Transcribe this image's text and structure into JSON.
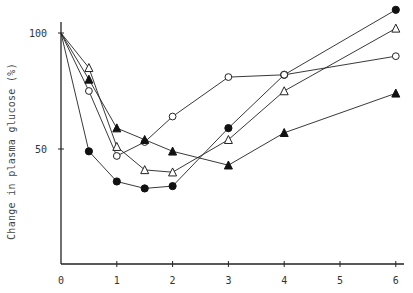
{
  "chart_data": {
    "type": "line",
    "title": "",
    "xlabel": "",
    "ylabel": "Change in plasma glucose (%)",
    "x_ticks": [
      "0",
      "1",
      "2",
      "3",
      "4",
      "5",
      "6"
    ],
    "y_ticks": [
      "50",
      "100"
    ],
    "xlim": [
      0,
      6
    ],
    "ylim": [
      0,
      115
    ],
    "grid": false,
    "legend": null,
    "series": [
      {
        "name": "filled-circle",
        "marker": "filled-circle",
        "x": [
          0,
          0.5,
          1,
          1.5,
          2,
          3,
          4,
          6
        ],
        "values": [
          100,
          49,
          36,
          33,
          34,
          59,
          82,
          110
        ]
      },
      {
        "name": "open-circle",
        "marker": "open-circle",
        "x": [
          0,
          0.5,
          1,
          1.5,
          2,
          3,
          4,
          6
        ],
        "values": [
          100,
          75,
          47,
          53,
          64,
          81,
          82,
          90
        ]
      },
      {
        "name": "open-triangle",
        "marker": "open-triangle",
        "x": [
          0,
          0.5,
          1,
          1.5,
          2,
          3,
          4,
          6
        ],
        "values": [
          100,
          85,
          51,
          41,
          40,
          54,
          75,
          102
        ]
      },
      {
        "name": "filled-triangle",
        "marker": "filled-triangle",
        "x": [
          0,
          0.5,
          1,
          1.5,
          2,
          3,
          4,
          6
        ],
        "values": [
          100,
          80,
          59,
          54,
          49,
          43,
          57,
          74
        ]
      }
    ]
  },
  "axis": {
    "ylabel": "Change in plasma glucose (%)"
  }
}
